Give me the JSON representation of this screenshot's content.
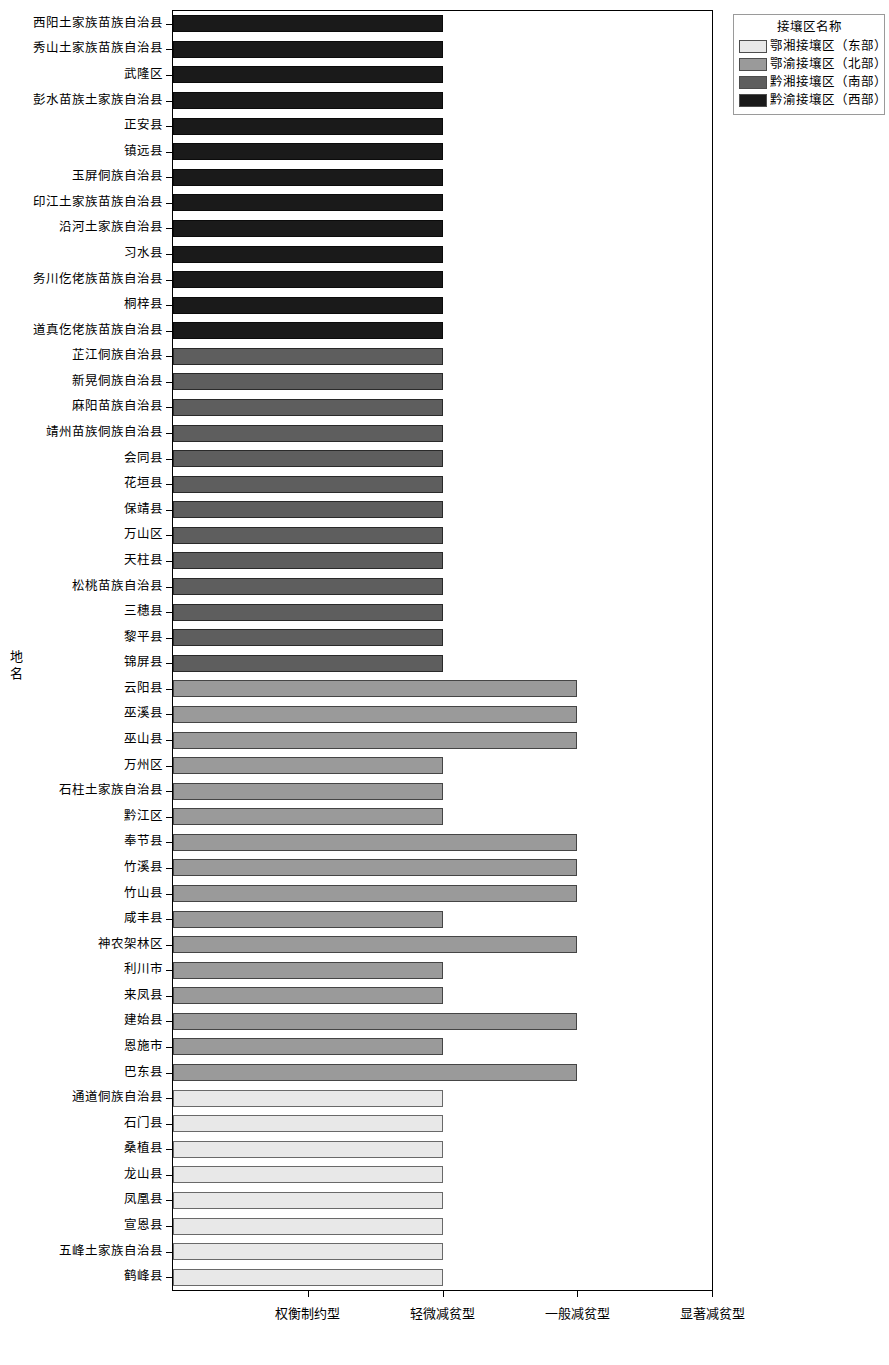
{
  "chart_data": {
    "type": "bar",
    "orientation": "horizontal",
    "title": "",
    "xlabel": "",
    "ylabel": "地名",
    "x_tick_labels": [
      "权衡制约型",
      "轻微减贫型",
      "一般减贫型",
      "显著减贫型"
    ],
    "x_tick_values": [
      1,
      2,
      3,
      4
    ],
    "xlim": [
      0,
      4
    ],
    "grid": false,
    "legend": {
      "title": "接壤区名称",
      "position": "top-right",
      "entries": [
        {
          "label": "鄂湘接壤区（东部）",
          "color": "#e8e8e8"
        },
        {
          "label": "鄂渝接壤区（北部）",
          "color": "#9a9a9a"
        },
        {
          "label": "黔湘接壤区（南部）",
          "color": "#5e5e5e"
        },
        {
          "label": "黔渝接壤区（西部）",
          "color": "#1a1a1a"
        }
      ]
    },
    "series": [
      {
        "name": "黔渝接壤区（西部）",
        "color": "#1a1a1a"
      },
      {
        "name": "黔湘接壤区（南部）",
        "color": "#5e5e5e"
      },
      {
        "name": "鄂渝接壤区（北部）",
        "color": "#9a9a9a"
      },
      {
        "name": "鄂湘接壤区（东部）",
        "color": "#e8e8e8"
      }
    ],
    "categories": [
      "西阳土家族苗族自治县",
      "秀山土家族苗族自治县",
      "武隆区",
      "彭水苗族土家族自治县",
      "正安县",
      "镇远县",
      "玉屏侗族自治县",
      "印江土家族苗族自治县",
      "沿河土家族自治县",
      "习水县",
      "务川仡佬族苗族自治县",
      "桐梓县",
      "道真仡佬族苗族自治县",
      "芷江侗族自治县",
      "新晃侗族自治县",
      "麻阳苗族自治县",
      "靖州苗族侗族自治县",
      "会同县",
      "花垣县",
      "保靖县",
      "万山区",
      "天柱县",
      "松桃苗族自治县",
      "三穗县",
      "黎平县",
      "锦屏县",
      "云阳县",
      "巫溪县",
      "巫山县",
      "万州区",
      "石柱土家族自治县",
      "黔江区",
      "奉节县",
      "竹溪县",
      "竹山县",
      "咸丰县",
      "神农架林区",
      "利川市",
      "来凤县",
      "建始县",
      "恩施市",
      "巴东县",
      "通道侗族自治县",
      "石门县",
      "桑植县",
      "龙山县",
      "凤凰县",
      "宣恩县",
      "五峰土家族自治县",
      "鹤峰县"
    ],
    "values": [
      2,
      2,
      2,
      2,
      2,
      2,
      2,
      2,
      2,
      2,
      2,
      2,
      2,
      2,
      2,
      2,
      2,
      2,
      2,
      2,
      2,
      2,
      2,
      2,
      2,
      2,
      3,
      3,
      3,
      2,
      2,
      2,
      3,
      3,
      3,
      2,
      3,
      2,
      2,
      3,
      2,
      3,
      2,
      2,
      2,
      2,
      2,
      2,
      2,
      2
    ],
    "group_index": [
      3,
      3,
      3,
      3,
      3,
      3,
      3,
      3,
      3,
      3,
      3,
      3,
      3,
      2,
      2,
      2,
      2,
      2,
      2,
      2,
      2,
      2,
      2,
      2,
      2,
      2,
      1,
      1,
      1,
      1,
      1,
      1,
      1,
      1,
      1,
      1,
      1,
      1,
      1,
      1,
      1,
      1,
      0,
      0,
      0,
      0,
      0,
      0,
      0,
      0
    ]
  }
}
